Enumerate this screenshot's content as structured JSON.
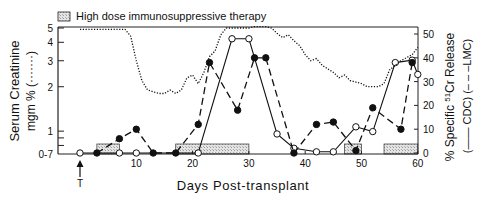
{
  "chart_data": {
    "type": "line",
    "title": "",
    "legend": {
      "therapy_label": "High dose immunosuppressive therapy",
      "position": "top-left"
    },
    "xlabel": "Days Post-transplant",
    "xlim": [
      -4,
      60
    ],
    "xticks": [
      10,
      20,
      30,
      40,
      50,
      60
    ],
    "x_marker": {
      "day": 0,
      "label": "T"
    },
    "ylabel_left": {
      "line1": "Serum Creatinine",
      "line2": "mgm % (·······)"
    },
    "yticks_left": [
      "0-7",
      "1",
      "2",
      "3",
      "4",
      "5"
    ],
    "ylim_left": [
      0.7,
      5
    ],
    "yscale_left": "log",
    "ylabel_right": {
      "line1": "% Specific 51Cr Release",
      "line2": "(—— CDC)      (– – –LMC)"
    },
    "yticks_right": [
      0,
      10,
      20,
      30,
      40,
      50
    ],
    "ylim_right": [
      0,
      52
    ],
    "series": [
      {
        "name": "CDC",
        "axis": "right",
        "style": "solid-open-circles",
        "x": [
          0,
          7,
          10,
          21,
          27,
          30,
          35,
          38,
          42,
          45,
          49,
          52,
          56,
          59,
          60
        ],
        "y": [
          0,
          0,
          0,
          0,
          48,
          48,
          8,
          2,
          0.5,
          0.5,
          11,
          9,
          38,
          39,
          33
        ]
      },
      {
        "name": "LMC",
        "axis": "right",
        "style": "dashed-filled-circles",
        "x": [
          3,
          7,
          10,
          13,
          17,
          21,
          23,
          28,
          31,
          33,
          38,
          42,
          45,
          49,
          52,
          57,
          59
        ],
        "y": [
          0,
          6,
          10,
          0,
          0,
          12,
          38,
          18,
          40,
          40,
          0,
          12,
          13,
          1,
          19,
          10,
          38
        ]
      },
      {
        "name": "Serum Creatinine",
        "axis": "left",
        "style": "dotted",
        "x": [
          0,
          8,
          9,
          10,
          11,
          12,
          14,
          15,
          16,
          17,
          18,
          19,
          20,
          21,
          22,
          23,
          24,
          25,
          26,
          28,
          30,
          31,
          33,
          34,
          35,
          36,
          37,
          38,
          39,
          40,
          41,
          42,
          43,
          45,
          46,
          47,
          48,
          50,
          51,
          52,
          53,
          54,
          55,
          57,
          59,
          60
        ],
        "y": [
          4.9,
          4.9,
          4.4,
          3.0,
          2.2,
          1.9,
          1.8,
          1.8,
          1.9,
          1.8,
          1.9,
          2.3,
          2.4,
          2.1,
          2.5,
          3.2,
          3.5,
          4.5,
          5.0,
          5.0,
          5.0,
          5.1,
          5.1,
          5.0,
          4.6,
          4.3,
          4.5,
          4.1,
          3.8,
          3.3,
          3.0,
          3.1,
          2.8,
          2.5,
          2.3,
          2.4,
          2.2,
          2.1,
          2.0,
          2.0,
          2.0,
          2.1,
          2.6,
          3.0,
          3.3,
          3.7
        ]
      }
    ],
    "therapy_periods": [
      [
        3,
        7
      ],
      [
        17,
        30
      ],
      [
        47,
        50
      ],
      [
        54,
        60
      ]
    ]
  }
}
